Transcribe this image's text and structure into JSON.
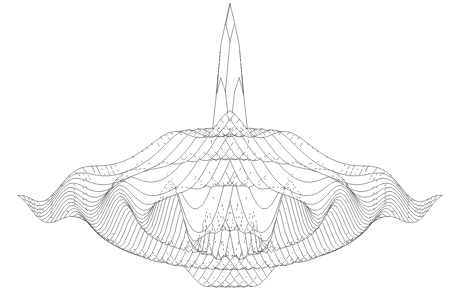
{
  "figure": {
    "title": "",
    "background_color": "#ffffff",
    "width": 455,
    "height": 301,
    "render_style": "wireframe-mesh",
    "line_color": "#2a2a2a",
    "line_width": 0.45,
    "hidden_line_removal": true,
    "axes_visible": false,
    "labels_visible": false,
    "legend_visible": false,
    "ticks_visible": false,
    "grid_visible": false
  },
  "chart_data": {
    "type": "line",
    "subtype": "surface-wireframe-3d",
    "title": "",
    "subtitle": "",
    "xlabel": "",
    "ylabel": "",
    "zlabel": "",
    "surface_function": "sinc",
    "function_expression": "z = sin(r) / r,  r = k * sqrt(x^2 + y^2)",
    "radial_frequency_k": 2.35,
    "amplitude": 1.0,
    "grid_lines_u": 47,
    "grid_lines_v": 47,
    "x": {
      "min": -8.0,
      "max": 8.0,
      "steps": 47
    },
    "y": {
      "min": -8.0,
      "max": 8.0,
      "steps": 47
    },
    "z": {
      "min": -0.22,
      "max": 1.0
    },
    "xlim": [
      -8.0,
      8.0
    ],
    "ylim": [
      -8.0,
      8.0
    ],
    "zlim": [
      -0.25,
      1.0
    ],
    "grid": false,
    "legend_position": "none",
    "projection": {
      "type": "isometric-oblique",
      "azimuth_deg": 45,
      "elevation_deg": 26,
      "vertical_exaggeration": 2.45
    },
    "screen_anchors": {
      "peak_apex": [
        222,
        18
      ],
      "left_corner": [
        18,
        200
      ],
      "right_corner": [
        442,
        196
      ],
      "front_corner": [
        228,
        288
      ],
      "back_corner": [
        225,
        118
      ]
    },
    "features": [
      {
        "name": "central-peak",
        "radius": 0.0,
        "height": 1.0,
        "kind": "maximum"
      },
      {
        "name": "first-trough",
        "radius": 1.9,
        "height": -0.217,
        "kind": "minimum"
      },
      {
        "name": "first-ripple",
        "radius": 3.1,
        "height": 0.128,
        "kind": "maximum"
      },
      {
        "name": "second-trough",
        "radius": 4.4,
        "height": -0.091,
        "kind": "minimum"
      },
      {
        "name": "second-ripple",
        "radius": 5.7,
        "height": 0.07,
        "kind": "maximum"
      },
      {
        "name": "third-trough",
        "radius": 7.0,
        "height": -0.055,
        "kind": "minimum"
      }
    ],
    "annotations": []
  }
}
